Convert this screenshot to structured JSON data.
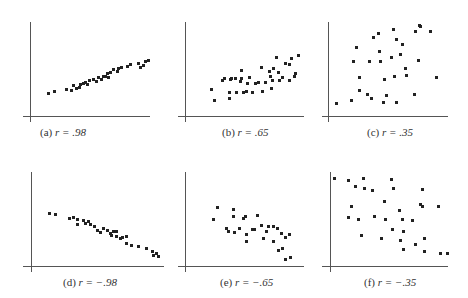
{
  "chart_data": [
    {
      "type": "scatter",
      "id": "a",
      "label": "(a)",
      "r_text": "r = .98",
      "panel": {
        "x": 0,
        "y": 0
      },
      "axes": {
        "yx": 30,
        "ytop": 22,
        "ybottom": 122,
        "xy": 116,
        "xleft": 23,
        "xright": 150
      },
      "caption": {
        "x": 40,
        "y": 126
      },
      "points": [
        [
          48,
          93
        ],
        [
          54,
          91
        ],
        [
          66,
          89
        ],
        [
          71,
          90
        ],
        [
          73,
          85
        ],
        [
          76,
          88
        ],
        [
          79,
          87
        ],
        [
          80,
          84
        ],
        [
          83,
          83
        ],
        [
          85,
          82
        ],
        [
          87,
          84
        ],
        [
          89,
          80
        ],
        [
          93,
          79
        ],
        [
          96,
          81
        ],
        [
          98,
          77
        ],
        [
          101,
          79
        ],
        [
          103,
          76
        ],
        [
          105,
          76
        ],
        [
          107,
          73
        ],
        [
          108,
          77
        ],
        [
          110,
          72
        ],
        [
          113,
          69
        ],
        [
          117,
          71
        ],
        [
          118,
          68
        ],
        [
          121,
          67
        ],
        [
          127,
          66
        ],
        [
          130,
          64
        ],
        [
          138,
          63
        ],
        [
          140,
          67
        ],
        [
          143,
          65
        ],
        [
          145,
          61
        ],
        [
          148,
          60
        ]
      ]
    },
    {
      "type": "scatter",
      "id": "b",
      "label": "(b)",
      "r_text": "r = .65",
      "panel": {
        "x": 0,
        "y": 0
      },
      "axes": {
        "yx": 185,
        "ytop": 22,
        "ybottom": 122,
        "xy": 116,
        "xleft": 178,
        "xright": 304
      },
      "caption": {
        "x": 222,
        "y": 126
      },
      "points": [
        [
          211,
          89
        ],
        [
          214,
          100
        ],
        [
          222,
          80
        ],
        [
          224,
          78
        ],
        [
          229,
          92
        ],
        [
          229,
          98
        ],
        [
          230,
          79
        ],
        [
          231,
          78
        ],
        [
          235,
          78
        ],
        [
          236,
          92
        ],
        [
          240,
          81
        ],
        [
          241,
          70
        ],
        [
          241,
          78
        ],
        [
          243,
          92
        ],
        [
          246,
          91
        ],
        [
          247,
          83
        ],
        [
          249,
          77
        ],
        [
          252,
          92
        ],
        [
          255,
          83
        ],
        [
          258,
          82
        ],
        [
          261,
          67
        ],
        [
          262,
          91
        ],
        [
          265,
          82
        ],
        [
          269,
          71
        ],
        [
          270,
          76
        ],
        [
          271,
          88
        ],
        [
          272,
          80
        ],
        [
          273,
          68
        ],
        [
          276,
          57
        ],
        [
          278,
          72
        ],
        [
          279,
          80
        ],
        [
          282,
          77
        ],
        [
          285,
          63
        ],
        [
          289,
          80
        ],
        [
          289,
          64
        ],
        [
          291,
          58
        ],
        [
          294,
          76
        ],
        [
          295,
          73
        ],
        [
          298,
          55
        ]
      ]
    },
    {
      "type": "scatter",
      "id": "c",
      "label": "(c)",
      "r_text": "r = .35",
      "panel": {
        "x": 0,
        "y": 0
      },
      "axes": {
        "yx": 328,
        "ytop": 22,
        "ybottom": 122,
        "xy": 116,
        "xleft": 322,
        "xright": 448
      },
      "caption": {
        "x": 367,
        "y": 126
      },
      "points": [
        [
          336,
          103
        ],
        [
          351,
          100
        ],
        [
          359,
          90
        ],
        [
          353,
          61
        ],
        [
          359,
          77
        ],
        [
          356,
          47
        ],
        [
          367,
          94
        ],
        [
          369,
          61
        ],
        [
          371,
          98
        ],
        [
          373,
          37
        ],
        [
          378,
          33
        ],
        [
          379,
          51
        ],
        [
          380,
          61
        ],
        [
          383,
          102
        ],
        [
          384,
          79
        ],
        [
          386,
          95
        ],
        [
          391,
          57
        ],
        [
          393,
          29
        ],
        [
          394,
          76
        ],
        [
          396,
          39
        ],
        [
          396,
          102
        ],
        [
          400,
          54
        ],
        [
          402,
          44
        ],
        [
          405,
          68
        ],
        [
          406,
          75
        ],
        [
          414,
          94
        ],
        [
          415,
          31
        ],
        [
          418,
          60
        ],
        [
          419,
          25
        ],
        [
          420,
          26
        ],
        [
          430,
          31
        ],
        [
          436,
          77
        ]
      ]
    },
    {
      "type": "scatter",
      "id": "d",
      "label": "(d)",
      "r_text": "r = -.98",
      "panel": {
        "x": 0,
        "y": 0
      },
      "axes": {
        "yx": 31,
        "ytop": 172,
        "ybottom": 272,
        "xy": 266,
        "xleft": 23,
        "xright": 164
      },
      "caption": {
        "x": 63,
        "y": 276
      },
      "points": [
        [
          49,
          213
        ],
        [
          55,
          214
        ],
        [
          69,
          218
        ],
        [
          73,
          217
        ],
        [
          77,
          219
        ],
        [
          77,
          224
        ],
        [
          83,
          220
        ],
        [
          85,
          223
        ],
        [
          88,
          221
        ],
        [
          90,
          224
        ],
        [
          94,
          226
        ],
        [
          97,
          230
        ],
        [
          100,
          232
        ],
        [
          103,
          228
        ],
        [
          107,
          230
        ],
        [
          110,
          233
        ],
        [
          111,
          235
        ],
        [
          113,
          231
        ],
        [
          116,
          231
        ],
        [
          116,
          236
        ],
        [
          120,
          238
        ],
        [
          122,
          237
        ],
        [
          126,
          236
        ],
        [
          126,
          243
        ],
        [
          131,
          245
        ],
        [
          138,
          246
        ],
        [
          146,
          248
        ],
        [
          152,
          251
        ],
        [
          153,
          255
        ],
        [
          156,
          253
        ],
        [
          158,
          256
        ]
      ]
    },
    {
      "type": "scatter",
      "id": "e",
      "label": "(e)",
      "r_text": "r = -.65",
      "panel": {
        "x": 0,
        "y": 0
      },
      "axes": {
        "yx": 185,
        "ytop": 172,
        "ybottom": 272,
        "xy": 266,
        "xleft": 178,
        "xright": 304
      },
      "caption": {
        "x": 220,
        "y": 276
      },
      "points": [
        [
          213,
          219
        ],
        [
          217,
          207
        ],
        [
          226,
          228
        ],
        [
          228,
          231
        ],
        [
          233,
          209
        ],
        [
          233,
          216
        ],
        [
          234,
          232
        ],
        [
          239,
          228
        ],
        [
          243,
          218
        ],
        [
          245,
          216
        ],
        [
          246,
          234
        ],
        [
          246,
          241
        ],
        [
          252,
          229
        ],
        [
          254,
          229
        ],
        [
          257,
          215
        ],
        [
          261,
          225
        ],
        [
          263,
          238
        ],
        [
          266,
          231
        ],
        [
          268,
          226
        ],
        [
          273,
          241
        ],
        [
          273,
          226
        ],
        [
          277,
          228
        ],
        [
          278,
          250
        ],
        [
          281,
          233
        ],
        [
          282,
          248
        ],
        [
          285,
          237
        ],
        [
          285,
          259
        ],
        [
          289,
          234
        ],
        [
          290,
          257
        ]
      ]
    },
    {
      "type": "scatter",
      "id": "f",
      "label": "(f)",
      "r_text": "r = -.35",
      "panel": {
        "x": 0,
        "y": 0
      },
      "axes": {
        "yx": 330,
        "ytop": 172,
        "ybottom": 272,
        "xy": 266,
        "xleft": 322,
        "xright": 448
      },
      "caption": {
        "x": 364,
        "y": 276
      },
      "points": [
        [
          334,
          178
        ],
        [
          348,
          180
        ],
        [
          355,
          186
        ],
        [
          363,
          178
        ],
        [
          364,
          188
        ],
        [
          351,
          206
        ],
        [
          348,
          217
        ],
        [
          358,
          219
        ],
        [
          361,
          235
        ],
        [
          372,
          190
        ],
        [
          374,
          216
        ],
        [
          381,
          238
        ],
        [
          384,
          201
        ],
        [
          385,
          219
        ],
        [
          391,
          179
        ],
        [
          392,
          229
        ],
        [
          393,
          188
        ],
        [
          399,
          210
        ],
        [
          400,
          240
        ],
        [
          402,
          219
        ],
        [
          403,
          249
        ],
        [
          403,
          231
        ],
        [
          412,
          220
        ],
        [
          415,
          244
        ],
        [
          422,
          206
        ],
        [
          424,
          238
        ],
        [
          424,
          251
        ],
        [
          438,
          206
        ],
        [
          440,
          253
        ],
        [
          447,
          253
        ],
        [
          422,
          189
        ],
        [
          420,
          204
        ]
      ]
    }
  ]
}
